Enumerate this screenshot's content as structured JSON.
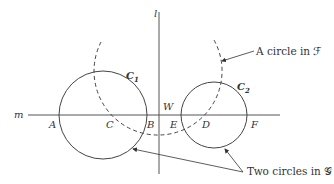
{
  "diagram": {
    "lines": [
      {
        "id": "l",
        "label": "l",
        "orientation": "vertical"
      },
      {
        "id": "m",
        "label": "m",
        "orientation": "horizontal"
      }
    ],
    "circles": [
      {
        "id": "C1",
        "label": "C",
        "subscript": "1",
        "style": "solid"
      },
      {
        "id": "C2",
        "label": "C",
        "subscript": "2",
        "style": "solid"
      },
      {
        "id": "dashed",
        "style": "dashed"
      }
    ],
    "points": {
      "A": "A",
      "C": "C",
      "B": "B",
      "W": "W",
      "E": "E",
      "D": "D",
      "F": "F"
    },
    "annotations": {
      "family_f": "A circle in ℱ",
      "family_g": "Two circles in 𝒢"
    },
    "colors": {
      "stroke": "#444444",
      "text": "#333333",
      "background": "#ffffff"
    }
  }
}
